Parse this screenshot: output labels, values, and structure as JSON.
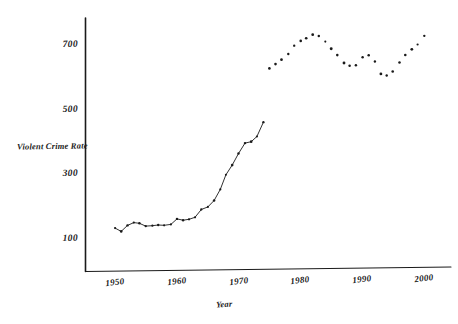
{
  "chart_data": {
    "type": "line",
    "title": "",
    "subtitle": "",
    "xlabel": "Year",
    "ylabel": "Violent Crime Rate",
    "xlim": [
      1946,
      2002
    ],
    "ylim": [
      0,
      790
    ],
    "grid": false,
    "legend": null,
    "xticks": [
      1950,
      1960,
      1970,
      1980,
      1990,
      2000
    ],
    "xtick_labels": [
      "1950",
      "1960",
      "1970",
      "1980",
      "1990",
      "2000"
    ],
    "yticks": [
      100,
      300,
      500,
      700
    ],
    "ytick_labels": [
      "100",
      "300",
      "500",
      "700"
    ],
    "style": "hand-drawn scan, black markers on white, no plot border, left spine and bottom spine only",
    "series": [
      {
        "name": "Violent Crime Rate (connected segment)",
        "marker": "dot",
        "connected": true,
        "x": [
          1950,
          1951,
          1952,
          1953,
          1954,
          1955,
          1956,
          1957,
          1958,
          1959,
          1960,
          1961,
          1962,
          1963,
          1964,
          1965,
          1966,
          1967,
          1968,
          1969,
          1970,
          1971,
          1972,
          1973,
          1974
        ],
        "values": [
          133,
          125,
          142,
          152,
          150,
          139,
          140,
          142,
          143,
          146,
          161,
          158,
          162,
          168,
          190,
          200,
          220,
          254,
          298,
          329,
          364,
          396,
          401,
          417,
          461
        ]
      },
      {
        "name": "Violent Crime Rate (scatter segment)",
        "marker": "dot",
        "connected": false,
        "x": [
          1975,
          1976,
          1977,
          1978,
          1979,
          1980,
          1981,
          1982,
          1983,
          1984,
          1985,
          1986,
          1987,
          1988,
          1989,
          1990,
          1991,
          1992,
          1993,
          1994,
          1995,
          1996,
          1997,
          1998,
          1999,
          2000
        ],
        "values": [
          628,
          640,
          654,
          672,
          697,
          712,
          722,
          731,
          727,
          710,
          687,
          669,
          645,
          635,
          638,
          663,
          668,
          649,
          612,
          605,
          617,
          645,
          668,
          688,
          702,
          728
        ]
      }
    ],
    "annotations": [
      "Early years 1950-1962 are nearly flat near 125-165",
      "Steep rise 1963-1974 from ~168 to ~461",
      "Peak plateau around 1980-1983 near 710-730",
      "Dip around 1993-1994 near 605-615",
      "Rise again toward 2000 near 728"
    ]
  },
  "axis": {
    "y_title": "Violent Crime Rate",
    "x_title": "Year"
  }
}
